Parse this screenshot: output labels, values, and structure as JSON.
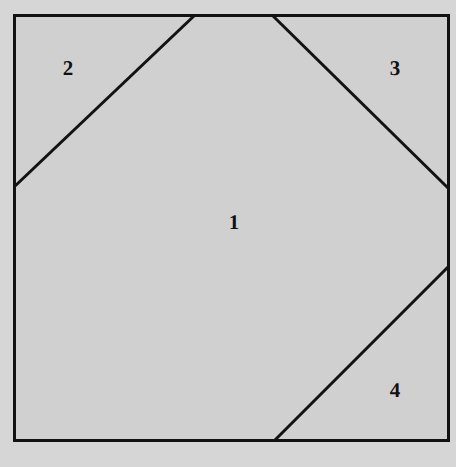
{
  "figure": {
    "colors": {
      "page_background": "#d5d5d5",
      "figure_fill": "#d6d6d6",
      "interior_fill": "#d0d0d0",
      "line_color": "#121212",
      "label_color": "#111111"
    },
    "canvas": {
      "width": 456,
      "height": 467
    },
    "square": {
      "name": "outer-square",
      "x1": 14,
      "y1": 15,
      "x2": 448,
      "y2": 440,
      "stroke_width": 3
    },
    "cuts": [
      {
        "name": "top-left-cut",
        "from": {
          "x": 14,
          "y": 187
        },
        "to": {
          "x": 195,
          "y": 15
        },
        "stroke_width": 3
      },
      {
        "name": "top-right-cut",
        "from": {
          "x": 272,
          "y": 15
        },
        "to": {
          "x": 448,
          "y": 188
        },
        "stroke_width": 3
      },
      {
        "name": "bottom-right-cut",
        "from": {
          "x": 275,
          "y": 440
        },
        "to": {
          "x": 448,
          "y": 267
        },
        "stroke_width": 3
      }
    ],
    "regions": [
      {
        "id": "region-1",
        "label": "1",
        "x": 234,
        "y": 222,
        "role": "central-octagon-region"
      },
      {
        "id": "region-2",
        "label": "2",
        "x": 68,
        "y": 68,
        "role": "top-left-corner-triangle"
      },
      {
        "id": "region-3",
        "label": "3",
        "x": 395,
        "y": 68,
        "role": "top-right-corner-triangle"
      },
      {
        "id": "region-4",
        "label": "4",
        "x": 395,
        "y": 390,
        "role": "bottom-right-corner-triangle"
      }
    ]
  }
}
